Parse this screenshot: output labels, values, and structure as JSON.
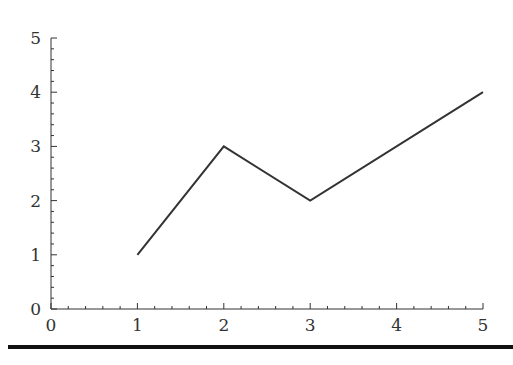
{
  "chart_data": {
    "type": "line",
    "title": "",
    "xlabel": "",
    "ylabel": "",
    "xlim": [
      0,
      5
    ],
    "ylim": [
      0,
      5
    ],
    "x_ticks": [
      "0",
      "1",
      "2",
      "3",
      "4",
      "5"
    ],
    "y_ticks": [
      "0",
      "1",
      "2",
      "3",
      "4",
      "5"
    ],
    "minor_ticks_per_major": 4,
    "grid": false,
    "legend": null,
    "series": [
      {
        "name": "series-1",
        "x": [
          1,
          2,
          3,
          5
        ],
        "y": [
          1,
          3,
          2,
          4
        ],
        "color": "#333333"
      }
    ]
  }
}
